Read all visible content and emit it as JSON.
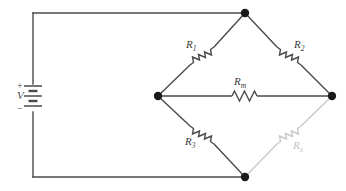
{
  "diagram": {
    "type": "wheatstone-bridge-circuit",
    "background_color": "#ffffff",
    "wire_color": "#4a4a4a",
    "faded_color": "#c9c9c9",
    "node_color": "#1a1a1a",
    "source": {
      "symbol": "battery",
      "voltage_label": "V",
      "plus_label": "+",
      "minus_label": "−"
    },
    "components": [
      {
        "id": "r1",
        "label": "R",
        "subscript": "1",
        "branch": "top-left",
        "faded": false
      },
      {
        "id": "r2",
        "label": "R",
        "subscript": "2",
        "branch": "top-right",
        "faded": false
      },
      {
        "id": "rm",
        "label": "R",
        "subscript": "m",
        "branch": "bridge-middle",
        "faded": false
      },
      {
        "id": "r3",
        "label": "R",
        "subscript": "3",
        "branch": "bottom-left",
        "faded": false
      },
      {
        "id": "rx",
        "label": "R",
        "subscript": "x",
        "branch": "bottom-right",
        "faded": true
      }
    ],
    "nodes": [
      {
        "id": "node-top",
        "x": 245,
        "y": 13
      },
      {
        "id": "node-left",
        "x": 158,
        "y": 96
      },
      {
        "id": "node-right",
        "x": 332,
        "y": 96
      },
      {
        "id": "node-bottom",
        "x": 245,
        "y": 177
      }
    ]
  }
}
